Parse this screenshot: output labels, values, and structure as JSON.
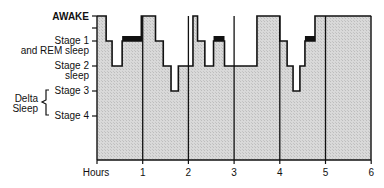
{
  "chart_data": {
    "type": "line",
    "subtype": "hypnogram-step-area",
    "title": "",
    "xlabel": "Hours",
    "ylabel": "",
    "x_ticks": [
      "1",
      "2",
      "3",
      "4",
      "5",
      "6"
    ],
    "xlim": [
      0,
      6
    ],
    "y_levels": [
      {
        "id": "awake",
        "label": "AWAKE",
        "level": 0
      },
      {
        "id": "stage1",
        "label": "Stage 1",
        "sublabel": "and REM sleep",
        "level": 1
      },
      {
        "id": "stage2",
        "label": "Stage 2",
        "sublabel": "sleep",
        "level": 2
      },
      {
        "id": "stage3",
        "label": "Stage 3",
        "level": 3
      },
      {
        "id": "stage4",
        "label": "Stage 4",
        "level": 4
      }
    ],
    "bracket_label": [
      "Delta",
      "Sleep"
    ],
    "bracket_spans": [
      "Stage 3",
      "Stage 4"
    ],
    "segments": [
      {
        "start": 0.0,
        "end": 0.2,
        "stage": "AWAKE"
      },
      {
        "start": 0.2,
        "end": 0.33,
        "stage": "Stage 1"
      },
      {
        "start": 0.33,
        "end": 0.55,
        "stage": "Stage 2"
      },
      {
        "start": 0.55,
        "end": 0.97,
        "stage": "Stage 1",
        "rem": true
      },
      {
        "start": 0.97,
        "end": 1.28,
        "stage": "AWAKE"
      },
      {
        "start": 1.28,
        "end": 1.45,
        "stage": "Stage 1"
      },
      {
        "start": 1.45,
        "end": 1.62,
        "stage": "Stage 2"
      },
      {
        "start": 1.62,
        "end": 1.78,
        "stage": "Stage 3"
      },
      {
        "start": 1.78,
        "end": 2.1,
        "stage": "Stage 2"
      },
      {
        "start": 2.1,
        "end": 2.2,
        "stage": "AWAKE"
      },
      {
        "start": 2.2,
        "end": 2.36,
        "stage": "Stage 1"
      },
      {
        "start": 2.36,
        "end": 2.55,
        "stage": "Stage 2"
      },
      {
        "start": 2.55,
        "end": 2.79,
        "stage": "Stage 1",
        "rem": true
      },
      {
        "start": 2.79,
        "end": 3.5,
        "stage": "Stage 2"
      },
      {
        "start": 3.5,
        "end": 4.0,
        "stage": "AWAKE"
      },
      {
        "start": 4.0,
        "end": 4.16,
        "stage": "Stage 1"
      },
      {
        "start": 4.16,
        "end": 4.29,
        "stage": "Stage 2"
      },
      {
        "start": 4.29,
        "end": 4.44,
        "stage": "Stage 3"
      },
      {
        "start": 4.44,
        "end": 4.55,
        "stage": "Stage 2"
      },
      {
        "start": 4.55,
        "end": 4.77,
        "stage": "Stage 1",
        "rem": true
      },
      {
        "start": 4.77,
        "end": 6.0,
        "stage": "AWAKE"
      }
    ],
    "hour_gridlines": [
      1,
      2,
      3,
      4,
      5
    ],
    "legend": null,
    "grid": false
  },
  "labels": {
    "awake": "AWAKE",
    "stage1_line1": "Stage 1",
    "stage1_line2": "and REM sleep",
    "stage2_line1": "Stage 2",
    "stage2_line2": "sleep",
    "stage3": "Stage 3",
    "stage4": "Stage 4",
    "delta_line1": "Delta",
    "delta_line2": "Sleep",
    "hours": "Hours",
    "ticks": [
      "1",
      "2",
      "3",
      "4",
      "5",
      "6"
    ]
  },
  "colors": {
    "fill": "#d6d6d6",
    "stroke": "#111111",
    "rem_bar": "#111111"
  }
}
